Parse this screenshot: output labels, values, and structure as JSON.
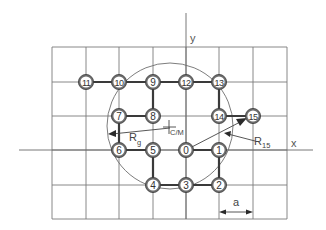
{
  "diagram": {
    "title": "",
    "axes": {
      "x_label": "x",
      "y_label": "y"
    },
    "grid": {
      "columns_x": [
        52,
        86,
        119,
        153,
        186,
        219,
        253,
        287
      ],
      "rows_y": [
        47,
        82,
        116,
        150,
        185,
        219
      ],
      "spacing_label": "a"
    },
    "nodes": [
      {
        "id": "0",
        "label": "0",
        "col": 4,
        "row": 3
      },
      {
        "id": "1",
        "label": "1",
        "col": 5,
        "row": 3
      },
      {
        "id": "2",
        "label": "2",
        "col": 5,
        "row": 4
      },
      {
        "id": "3",
        "label": "3",
        "col": 4,
        "row": 4
      },
      {
        "id": "4",
        "label": "4",
        "col": 3,
        "row": 4
      },
      {
        "id": "5",
        "label": "5",
        "col": 3,
        "row": 3
      },
      {
        "id": "6",
        "label": "6",
        "col": 2,
        "row": 3
      },
      {
        "id": "7",
        "label": "7",
        "col": 2,
        "row": 2
      },
      {
        "id": "8",
        "label": "8",
        "col": 3,
        "row": 2
      },
      {
        "id": "9",
        "label": "9",
        "col": 3,
        "row": 1
      },
      {
        "id": "10",
        "label": "10",
        "col": 2,
        "row": 1
      },
      {
        "id": "11",
        "label": "11",
        "col": 1,
        "row": 1
      },
      {
        "id": "12",
        "label": "12",
        "col": 4,
        "row": 1
      },
      {
        "id": "13",
        "label": "13",
        "col": 5,
        "row": 1
      },
      {
        "id": "14",
        "label": "14",
        "col": 5,
        "row": 2
      },
      {
        "id": "15",
        "label": "15",
        "col": 6,
        "row": 2
      }
    ],
    "bonds": [
      [
        "0",
        "1"
      ],
      [
        "1",
        "2"
      ],
      [
        "2",
        "3"
      ],
      [
        "3",
        "4"
      ],
      [
        "4",
        "5"
      ],
      [
        "5",
        "6"
      ],
      [
        "6",
        "7"
      ],
      [
        "7",
        "8"
      ],
      [
        "8",
        "9"
      ],
      [
        "9",
        "10"
      ],
      [
        "10",
        "11"
      ],
      [
        "9",
        "12"
      ],
      [
        "12",
        "13"
      ],
      [
        "13",
        "14"
      ],
      [
        "14",
        "15"
      ]
    ],
    "center_of_mass": {
      "label": "C/M",
      "x": 170,
      "y": 127
    },
    "gyration_circle": {
      "cx": 170,
      "cy": 126,
      "r": 63
    },
    "annotations": {
      "radius_gyration": {
        "main": "R",
        "sub": "g"
      },
      "radius_15": {
        "main": "R",
        "sub": "15"
      },
      "lattice_spacing": "a"
    },
    "colors": {
      "grid": "#7a7a7a",
      "bond": "#3a3a3a",
      "node_ring": "#6d6d6d",
      "node_fill": "#ffffff",
      "text": "#444444"
    }
  }
}
